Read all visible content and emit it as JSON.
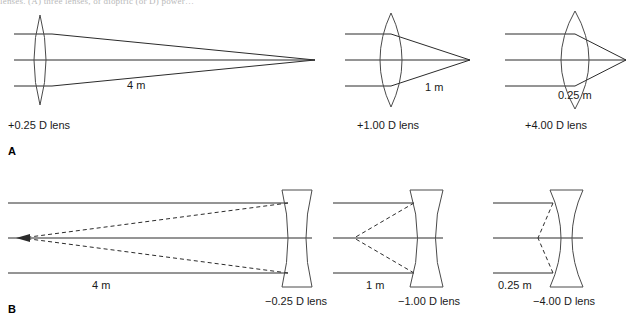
{
  "figure": {
    "cropped_caption_fragment": "lenses. (A) three lenses, of dioptric (or D) power…",
    "panels": [
      {
        "letter": "A",
        "type": "converging",
        "description": "Parallel rays converging to a real focus after passing through convex lenses",
        "groups": [
          {
            "distance_label": "4 m",
            "lens_label": "+0.25 D lens",
            "power_diopters": 0.25,
            "focal_length_m": 4,
            "lens_shape": "biconvex-thin"
          },
          {
            "distance_label": "1 m",
            "lens_label": "+1.00 D lens",
            "power_diopters": 1.0,
            "focal_length_m": 1,
            "lens_shape": "biconvex-medium"
          },
          {
            "distance_label": "0.25 m",
            "lens_label": "+4.00 D lens",
            "power_diopters": 4.0,
            "focal_length_m": 0.25,
            "lens_shape": "biconvex-thick"
          }
        ]
      },
      {
        "letter": "B",
        "type": "diverging",
        "description": "Parallel rays diverging, traced back by dashed lines to a virtual focus before concave lenses",
        "groups": [
          {
            "distance_label": "4 m",
            "lens_label": "−0.25 D lens",
            "power_diopters": -0.25,
            "focal_length_m": -4,
            "lens_shape": "biconcave-thin"
          },
          {
            "distance_label": "1 m",
            "lens_label": "−1.00 D lens",
            "power_diopters": -1.0,
            "focal_length_m": -1,
            "lens_shape": "biconcave-medium"
          },
          {
            "distance_label": "0.25 m",
            "lens_label": "−4.00 D lens",
            "power_diopters": -4.0,
            "focal_length_m": -0.25,
            "lens_shape": "biconcave-thick"
          }
        ]
      }
    ],
    "colors": {
      "line": "#2b2b2b",
      "lens": "#4a4a4a",
      "text": "#1a1a1a",
      "background": "#ffffff"
    }
  }
}
